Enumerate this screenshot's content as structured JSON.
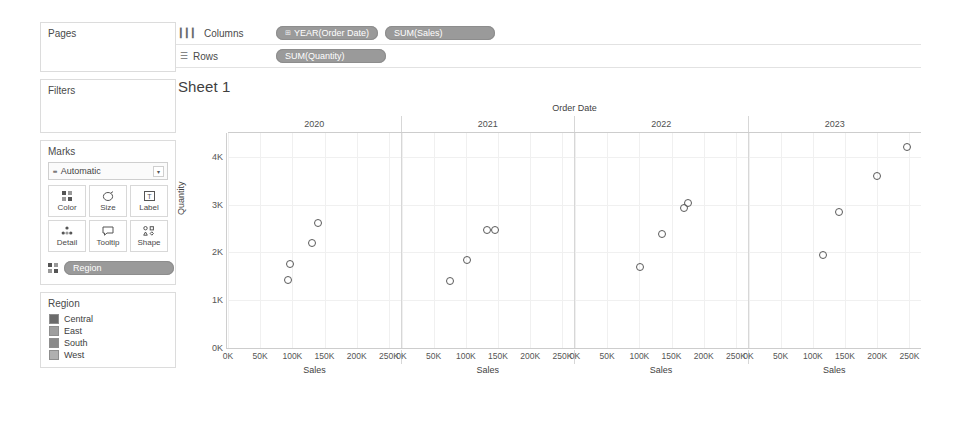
{
  "sidebar": {
    "pages": {
      "title": "Pages"
    },
    "filters": {
      "title": "Filters"
    },
    "marks": {
      "title": "Marks",
      "mark_type": "Automatic",
      "mark_type_icon": "mark-type-icon",
      "caret_icon": "▾",
      "buttons": [
        {
          "label": "Color",
          "icon": "color-icon"
        },
        {
          "label": "Size",
          "icon": "size-icon"
        },
        {
          "label": "Label",
          "icon": "label-icon"
        },
        {
          "label": "Detail",
          "icon": "detail-icon"
        },
        {
          "label": "Tooltip",
          "icon": "tooltip-icon"
        },
        {
          "label": "Shape",
          "icon": "shape-icon"
        }
      ],
      "pill": {
        "label": "Region",
        "icon": "color-icon"
      }
    },
    "legend": {
      "title": "Region",
      "items": [
        {
          "label": "Central",
          "color": "#6b6b6b"
        },
        {
          "label": "East",
          "color": "#9e9e9e"
        },
        {
          "label": "South",
          "color": "#8a8a8a"
        },
        {
          "label": "West",
          "color": "#b0b0b0"
        }
      ]
    }
  },
  "shelves": {
    "columns": {
      "label": "Columns",
      "icon": "columns-icon",
      "pills": [
        {
          "text": "YEAR(Order Date)",
          "icon": "⊞"
        },
        {
          "text": "SUM(Sales)",
          "icon": ""
        }
      ]
    },
    "rows": {
      "label": "Rows",
      "icon": "rows-icon",
      "pills": [
        {
          "text": "SUM(Quantity)",
          "icon": ""
        }
      ]
    }
  },
  "sheet": {
    "title": "Sheet 1"
  },
  "chart_data": {
    "type": "scatter",
    "title": "Sheet 1",
    "column_header": "Order Date",
    "panels": [
      "2020",
      "2021",
      "2022",
      "2023"
    ],
    "xlabel": "Sales",
    "ylabel": "Quantity",
    "xticks": [
      "0K",
      "50K",
      "100K",
      "150K",
      "200K",
      "250K"
    ],
    "xtick_values": [
      0,
      50000,
      100000,
      150000,
      200000,
      250000
    ],
    "yticks": [
      "0K",
      "1K",
      "2K",
      "3K",
      "4K"
    ],
    "ytick_values": [
      0,
      1000,
      2000,
      3000,
      4000
    ],
    "xlim": [
      0,
      268000
    ],
    "ylim": [
      0,
      4500
    ],
    "grid": true,
    "legend": "Region",
    "series": [
      {
        "name": "2020",
        "points": [
          {
            "region": "South",
            "sales": 93000,
            "quantity": 1430
          },
          {
            "region": "East",
            "sales": 97000,
            "quantity": 1760
          },
          {
            "region": "West",
            "sales": 131000,
            "quantity": 2200
          },
          {
            "region": "Central",
            "sales": 140000,
            "quantity": 2620
          }
        ]
      },
      {
        "name": "2021",
        "points": [
          {
            "region": "South",
            "sales": 76000,
            "quantity": 1410
          },
          {
            "region": "East",
            "sales": 101000,
            "quantity": 1850
          },
          {
            "region": "West",
            "sales": 133000,
            "quantity": 2480
          },
          {
            "region": "Central",
            "sales": 146000,
            "quantity": 2480
          }
        ]
      },
      {
        "name": "2022",
        "points": [
          {
            "region": "South",
            "sales": 101000,
            "quantity": 1690
          },
          {
            "region": "East",
            "sales": 135000,
            "quantity": 2380
          },
          {
            "region": "West",
            "sales": 170000,
            "quantity": 2930
          },
          {
            "region": "Central",
            "sales": 175000,
            "quantity": 3040
          }
        ]
      },
      {
        "name": "2023",
        "points": [
          {
            "region": "South",
            "sales": 116000,
            "quantity": 1950
          },
          {
            "region": "East",
            "sales": 141000,
            "quantity": 2840
          },
          {
            "region": "West",
            "sales": 199000,
            "quantity": 3590
          },
          {
            "region": "Central",
            "sales": 247000,
            "quantity": 4210
          }
        ]
      }
    ]
  }
}
